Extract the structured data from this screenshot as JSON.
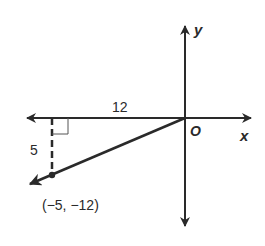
{
  "diagram": {
    "type": "coordinate-plane-angle",
    "axes": {
      "x_label": "x",
      "y_label": "y",
      "origin_label": "O"
    },
    "segment_labels": {
      "horizontal": "12",
      "vertical": "5"
    },
    "point": {
      "label": "(−5, −12)",
      "x": -5,
      "y": -12
    },
    "colors": {
      "stroke": "#2a2a2a",
      "background": "#ffffff"
    }
  }
}
